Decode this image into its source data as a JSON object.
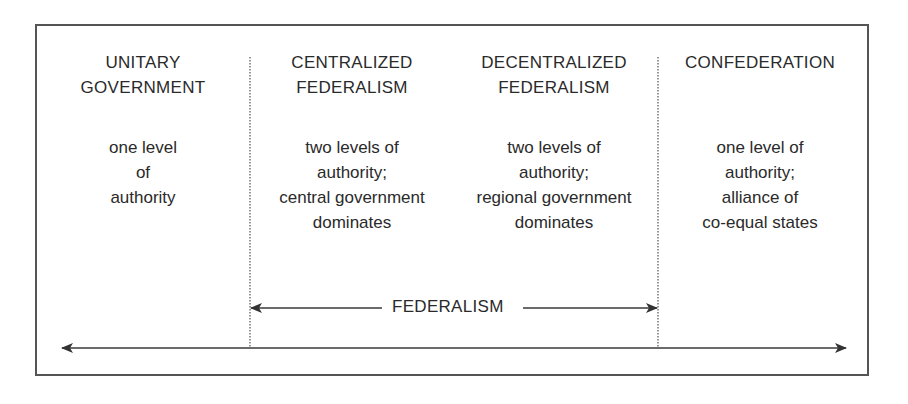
{
  "diagram": {
    "columns": [
      {
        "title": "UNITARY\nGOVERNMENT",
        "description": "one level\nof\nauthority"
      },
      {
        "title": "CENTRALIZED\nFEDERALISM",
        "description": "two levels of\nauthority;\ncentral government\ndominates"
      },
      {
        "title": "DECENTRALIZED\nFEDERALISM",
        "description": "two levels of\nauthority;\nregional government\ndominates"
      },
      {
        "title": "CONFEDERATION",
        "description": "one level of\nauthority;\nalliance of\nco-equal states"
      }
    ],
    "federalism_span_label": "FEDERALISM",
    "colors": {
      "line": "#3a3a3a",
      "border": "#555555",
      "text": "#2a2a2a"
    }
  }
}
